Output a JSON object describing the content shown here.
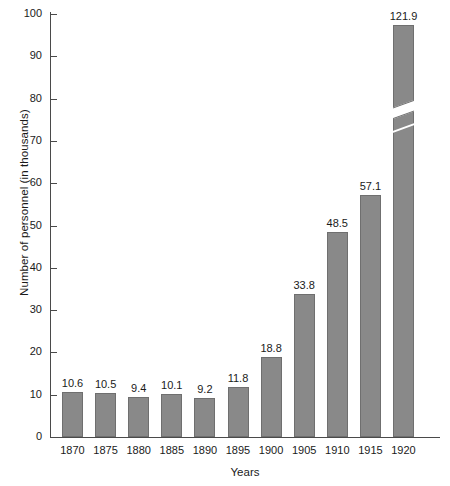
{
  "chart_data": {
    "type": "bar",
    "title": "",
    "xlabel": "Years",
    "ylabel": "Number of personnel (in thousands)",
    "categories": [
      "1870",
      "1875",
      "1880",
      "1885",
      "1890",
      "1895",
      "1900",
      "1905",
      "1910",
      "1915",
      "1920"
    ],
    "values": [
      10.6,
      10.5,
      9.4,
      10.1,
      9.2,
      11.8,
      18.8,
      33.8,
      48.5,
      57.1,
      121.9
    ],
    "value_labels": [
      "10.6",
      "10.5",
      "9.4",
      "10.1",
      "9.2",
      "11.8",
      "18.8",
      "33.8",
      "48.5",
      "57.1",
      "121.9"
    ],
    "ylim": [
      0,
      100
    ],
    "ytick_labels": [
      "0",
      "10",
      "20",
      "30",
      "40",
      "50",
      "60",
      "70",
      "80",
      "90",
      "100"
    ],
    "ytick_values": [
      0,
      10,
      20,
      30,
      40,
      50,
      60,
      70,
      80,
      90,
      100
    ],
    "grid": false,
    "legend": "none",
    "axis_break": {
      "present": true,
      "on_category": "1920",
      "note": "bar value 121.9 exceeds axis maximum of 100; bar drawn with a diagonal break"
    },
    "colors": {
      "bar_fill": "#898989",
      "bar_border": "#6f6f6f",
      "axis": "#4a4a4a",
      "text": "#1a1a1a",
      "background": "#ffffff"
    }
  }
}
